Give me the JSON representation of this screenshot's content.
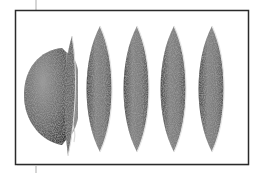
{
  "figure": {
    "frame_color": "#2a2a2a",
    "fill_color": "#7a7a7a",
    "highlight_color": "#d9d9d9",
    "shadow_color": "#3c3c3c",
    "shapes": [
      {
        "kind": "hemisphere",
        "label": "hemisphere"
      },
      {
        "kind": "crescent-blade",
        "label": "blade"
      },
      {
        "kind": "lens",
        "label": "lens-1"
      },
      {
        "kind": "lens",
        "label": "lens-2"
      },
      {
        "kind": "lens",
        "label": "lens-3"
      },
      {
        "kind": "lens",
        "label": "lens-4"
      },
      {
        "kind": "lens",
        "label": "lens-5"
      }
    ]
  }
}
